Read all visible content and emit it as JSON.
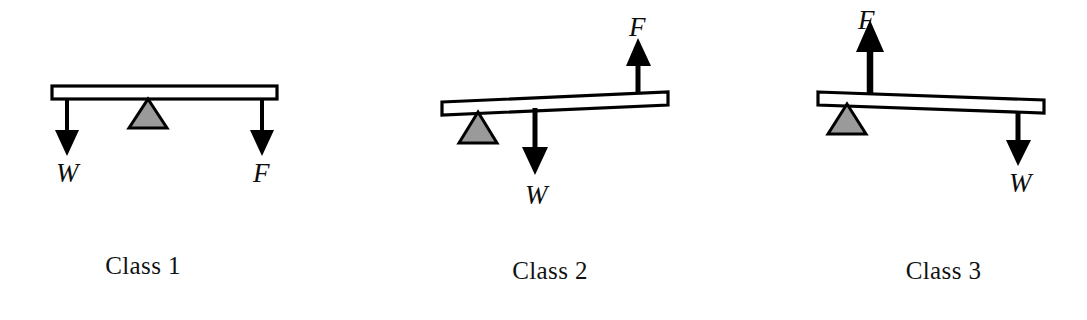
{
  "figure": {
    "background_color": "#ffffff",
    "stroke_color": "#000000",
    "fulcrum_fill_color": "#9a9a9a",
    "beam_fill_color": "#ffffff"
  },
  "panels": [
    {
      "id": "class-1",
      "caption": "Class 1",
      "beam": {
        "tilt": "level"
      },
      "fulcrum": {
        "position": "center",
        "under_beam": true
      },
      "forces": [
        {
          "symbol": "W",
          "name": "load",
          "direction": "down",
          "location": "left-end"
        },
        {
          "symbol": "F",
          "name": "effort",
          "direction": "down",
          "location": "right-end"
        }
      ]
    },
    {
      "id": "class-2",
      "caption": "Class 2",
      "beam": {
        "tilt": "up-to-right"
      },
      "fulcrum": {
        "position": "left-end",
        "under_beam": true
      },
      "forces": [
        {
          "symbol": "W",
          "name": "load",
          "direction": "down",
          "location": "middle"
        },
        {
          "symbol": "F",
          "name": "effort",
          "direction": "up",
          "location": "right-end"
        }
      ]
    },
    {
      "id": "class-3",
      "caption": "Class 3",
      "beam": {
        "tilt": "down-to-right"
      },
      "fulcrum": {
        "position": "left-end",
        "under_beam": true
      },
      "forces": [
        {
          "symbol": "F",
          "name": "effort",
          "direction": "up",
          "location": "left-inner"
        },
        {
          "symbol": "W",
          "name": "load",
          "direction": "down",
          "location": "right-end"
        }
      ]
    }
  ]
}
